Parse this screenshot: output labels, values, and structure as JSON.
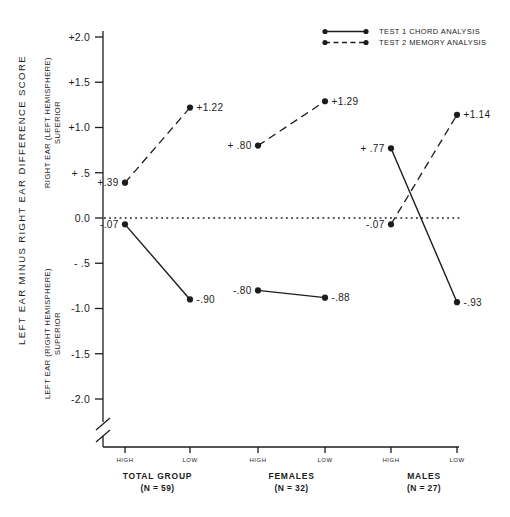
{
  "figure": {
    "background_color": "#ffffff",
    "ink_color": "#1c1c1c"
  },
  "chart_data": {
    "type": "line",
    "title": "",
    "ylabel": "LEFT EAR MINUS RIGHT EAR  DIFFERENCE SCORE",
    "y_region_labels": {
      "upper_line1": "RIGHT EAR (LEFT HEMISPHERE)",
      "upper_line2": "SUPERIOR",
      "lower_line1": "LEFT EAR (RIGHT HEMISPHERE)",
      "lower_line2": "SUPERIOR"
    },
    "ylim": [
      -2.0,
      2.0
    ],
    "axis_break": true,
    "zero_line_style": "dotted",
    "grid": false,
    "legend_position": "top-right",
    "y_ticks": [
      {
        "value": 2.0,
        "label": "+2.0"
      },
      {
        "value": 1.5,
        "label": "+1.5"
      },
      {
        "value": 1.0,
        "label": "+1.0"
      },
      {
        "value": 0.5,
        "label": "+ .5"
      },
      {
        "value": 0.0,
        "label": "0.0"
      },
      {
        "value": -0.5,
        "label": "- .5"
      },
      {
        "value": -1.0,
        "label": "-1.0"
      },
      {
        "value": -1.5,
        "label": "-1.5"
      },
      {
        "value": -2.0,
        "label": "-2.0"
      }
    ],
    "x_categories": [
      "HIGH",
      "LOW"
    ],
    "groups": [
      {
        "name": "TOTAL GROUP",
        "n_label": "(N = 59)"
      },
      {
        "name": "FEMALES",
        "n_label": "(N = 32)"
      },
      {
        "name": "MALES",
        "n_label": "(N = 27)"
      }
    ],
    "series": [
      {
        "name": "TEST 1 CHORD ANALYSIS",
        "line_style": "solid",
        "values": [
          [
            -0.07,
            -0.9
          ],
          [
            -0.8,
            -0.88
          ],
          [
            0.77,
            -0.93
          ]
        ],
        "point_labels": [
          [
            "-.07",
            "-.90"
          ],
          [
            "-.80",
            "-.88"
          ],
          [
            "+ .77",
            "-.93"
          ]
        ]
      },
      {
        "name": "TEST 2 MEMORY ANALYSIS",
        "line_style": "dashed",
        "values": [
          [
            0.39,
            1.22
          ],
          [
            0.8,
            1.29
          ],
          [
            -0.07,
            1.14
          ]
        ],
        "point_labels": [
          [
            "+.39",
            "+1.22"
          ],
          [
            "+ .80",
            "+1.29"
          ],
          [
            "-.07",
            "+1.14"
          ]
        ]
      }
    ]
  }
}
